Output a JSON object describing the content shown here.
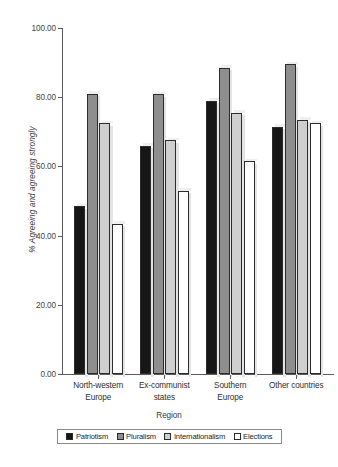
{
  "chart_data": {
    "type": "bar",
    "title": "",
    "subtitle": "",
    "xlabel": "Region",
    "ylabel": "% Agreeing and agreeing strongly",
    "ylim": [
      0,
      100
    ],
    "yticks": [
      "0.00",
      "20.00",
      "40.00",
      "60.00",
      "80.00",
      "100.00"
    ],
    "ytick_values": [
      0,
      20,
      40,
      60,
      80,
      100
    ],
    "grid": false,
    "legend_position": "bottom",
    "categories": [
      "North-western Europe",
      "Ex-communist states",
      "Southern Europe",
      "Other countries"
    ],
    "category_lines": [
      [
        "North-western",
        "Europe"
      ],
      [
        "Ex-communist",
        "states"
      ],
      [
        "Southern",
        "Europe"
      ],
      [
        "Other countries"
      ]
    ],
    "series": [
      {
        "name": "Patriotism",
        "color": "#161616",
        "values": [
          48.5,
          66.0,
          79.0,
          71.5
        ]
      },
      {
        "name": "Pluralism",
        "color": "#8e8e8e",
        "values": [
          81.0,
          80.8,
          88.5,
          89.5
        ]
      },
      {
        "name": "Internationalism",
        "color": "#cfcfcf",
        "values": [
          72.5,
          67.5,
          75.5,
          73.5
        ]
      },
      {
        "name": "Elections",
        "color": "#ffffff",
        "values": [
          43.5,
          53.0,
          61.5,
          72.5
        ]
      }
    ]
  },
  "axes": {
    "y_title": "% Agreeing and agreeing strongly",
    "x_title": "Region"
  },
  "legend": {
    "items": [
      {
        "label": "Patriotism",
        "color": "#161616"
      },
      {
        "label": "Pluralism",
        "color": "#8e8e8e"
      },
      {
        "label": "Internationalism",
        "color": "#cfcfcf"
      },
      {
        "label": "Elections",
        "color": "#ffffff"
      }
    ]
  },
  "colors": {
    "axis": "#5b5b5b",
    "bar_outline": "#2c2c2c",
    "text": "#2e2e2e",
    "shadow": "#e4e4e4"
  }
}
